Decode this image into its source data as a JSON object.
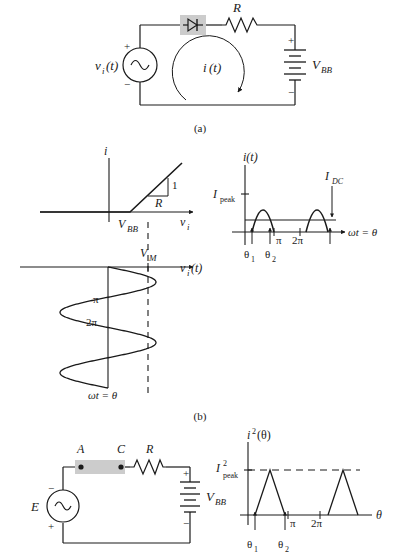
{
  "figure": {
    "captions": {
      "a": "(a)",
      "b": "(b)"
    }
  },
  "circuit_a": {
    "source_label": "v",
    "source_sub": "i",
    "source_arg": "(t)",
    "source_plus": "+",
    "source_minus": "−",
    "diode_name": "diode",
    "resistor_label": "R",
    "battery_label": "V",
    "battery_sub": "BB",
    "battery_plus": "+",
    "battery_minus": "−",
    "loop_current": "i",
    "loop_current_arg": "(t)"
  },
  "plot_iv": {
    "yaxis_label": "i",
    "xaxis_label": "v",
    "xaxis_sub": "i",
    "knee_label": "V",
    "knee_sub": "BB",
    "slope_rise": "1",
    "slope_run": "R"
  },
  "plot_it": {
    "yaxis_label": "i(t)",
    "xaxis_label": "ωt = θ",
    "peak_label": "I",
    "peak_sub": "peak",
    "dc_label": "I",
    "dc_sub": "DC",
    "ticks": [
      "π",
      "2π"
    ],
    "theta1": "θ",
    "theta1_sub": "1",
    "theta2": "θ",
    "theta2_sub": "2"
  },
  "plot_vin": {
    "axis_label": "v",
    "axis_sub": "i",
    "axis_arg": "(t)",
    "vm_label": "V",
    "vm_sub": "M",
    "time_label": "ωt = θ",
    "ticks": [
      "π",
      "2π"
    ]
  },
  "circuit_c": {
    "source_label": "E",
    "source_plus": "+",
    "source_minus": "−",
    "node_a": "A",
    "node_c": "C",
    "resistor_label": "R",
    "battery_label": "V",
    "battery_sub": "BB",
    "battery_plus": "+",
    "battery_minus": "−"
  },
  "plot_i2": {
    "yaxis_label": "i",
    "yaxis_sup": "2",
    "yaxis_arg": "(θ)",
    "xaxis_label": "θ",
    "peak_label": "I",
    "peak_sup": "2",
    "peak_sub": "peak",
    "ticks": [
      "π",
      "2π"
    ],
    "theta1": "θ",
    "theta1_sub": "1",
    "theta2": "θ",
    "theta2_sub": "2"
  },
  "chart_data": [
    {
      "type": "line",
      "name": "diode-resistor i-v characteristic",
      "title": "",
      "xlabel": "v_i",
      "ylabel": "i",
      "description": "piecewise linear: zero for v_i < V_BB, slope 1/R above",
      "breakpoint": "V_BB",
      "slope": "1/R",
      "x": [
        -1.0,
        0.0,
        1.0
      ],
      "y": [
        0.0,
        0.0,
        1.0
      ]
    },
    {
      "type": "line",
      "name": "rectified current pulses i(t)",
      "xlabel": "ωt = θ",
      "ylabel": "i(t)",
      "annotations": [
        "I_peak",
        "I_DC",
        "θ_1",
        "θ_2"
      ],
      "xticks": [
        "π",
        "2π"
      ],
      "conduction_intervals": [
        [
          0.35,
          2.79
        ],
        [
          6.63,
          9.07
        ]
      ],
      "peak": 1.0,
      "dc_level": 0.3
    },
    {
      "type": "line",
      "name": "input sinusoid v_i(t) plotted with vertical time axis",
      "xlabel": "v_i(t)",
      "ylabel": "ωt = θ",
      "yticks": [
        "π",
        "2π"
      ],
      "amplitude_label": "V_M",
      "cycles": 2
    },
    {
      "type": "line",
      "name": "squared current i²(θ)",
      "xlabel": "θ",
      "ylabel": "i²(θ)",
      "annotations": [
        "I²_peak",
        "θ_1",
        "θ_2"
      ],
      "xticks": [
        "π",
        "2π"
      ],
      "shape": "triangular pulses",
      "peak": 1.0
    }
  ]
}
